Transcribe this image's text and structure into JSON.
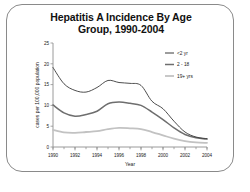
{
  "figure": {
    "title_line1": "Hepatitis A Incidence By Age",
    "title_line2": "Group, 1990-2004",
    "border_color": "#8a8a8a",
    "background": "#ffffff"
  },
  "chart_data": {
    "type": "line",
    "title": "Hepatitis A Incidence By Age Group, 1990-2004",
    "xlabel": "Year",
    "ylabel": "cases per 100,000 population",
    "xlim": [
      1990,
      2004
    ],
    "ylim": [
      0,
      25
    ],
    "yticks": [
      0,
      5,
      10,
      15,
      20,
      25
    ],
    "ytick_labels": [
      "0",
      "5",
      "10",
      "15",
      "20",
      "25"
    ],
    "xticks": [
      1990,
      1992,
      1994,
      1996,
      1998,
      2000,
      2002,
      2004
    ],
    "xtick_labels": [
      "1990",
      "1992",
      "1994",
      "1996",
      "1998",
      "2000",
      "2002",
      "2004"
    ],
    "minor_xticks_interval": 1,
    "grid": false,
    "legend_position": "upper right",
    "x": [
      1990,
      1991,
      1992,
      1993,
      1994,
      1995,
      1996,
      1997,
      1998,
      1999,
      2000,
      2001,
      2002,
      2003,
      2004
    ],
    "series": [
      {
        "name": "<2 yr",
        "color": "#3a3a3a",
        "width": 0.9,
        "values": [
          19.1,
          15.2,
          13.6,
          13.2,
          14.3,
          16.0,
          15.5,
          15.3,
          14.8,
          11.0,
          9.2,
          6.2,
          3.6,
          2.4,
          2.0
        ]
      },
      {
        "name": "2 - 18",
        "color": "#6e6e6e",
        "width": 1.5,
        "values": [
          10.1,
          8.2,
          7.4,
          7.8,
          8.6,
          10.4,
          10.8,
          10.5,
          10.0,
          8.4,
          6.6,
          4.6,
          3.0,
          2.2,
          1.9
        ]
      },
      {
        "name": "19+ yrs",
        "color": "#c2c2c2",
        "width": 1.8,
        "values": [
          4.1,
          3.5,
          3.4,
          3.6,
          3.8,
          4.3,
          4.6,
          4.5,
          4.3,
          3.6,
          2.8,
          2.0,
          1.4,
          1.1,
          1.0
        ]
      }
    ]
  },
  "legend": {
    "entries": [
      {
        "label": "<2 yr"
      },
      {
        "label": "2 - 18"
      },
      {
        "label": "19+ yrs"
      }
    ]
  }
}
